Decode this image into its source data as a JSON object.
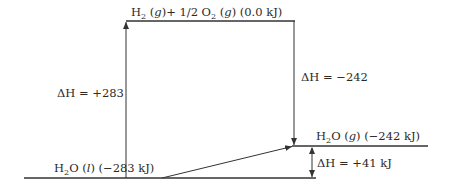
{
  "diagram": {
    "type": "enthalpy-level-diagram",
    "levels": {
      "top": {
        "species": "H",
        "sub": "2",
        "rest1": " (",
        "state": "g",
        "rest2": ")+ 1/2 O",
        "sub2": "2",
        "rest3": " (",
        "state2": "g",
        "rest4": ") (0.0 kJ)"
      },
      "gas": {
        "species": "H",
        "sub": "2",
        "rest1": "O (",
        "state": "g",
        "rest2": ") (−242 kJ)"
      },
      "liquid": {
        "species": "H",
        "sub": "2",
        "rest1": "O (",
        "state": "l",
        "rest2": ") (−283 kJ)"
      }
    },
    "arrows": {
      "up": {
        "label": "ΔH = +283"
      },
      "down": {
        "label": "ΔH = −242"
      },
      "vap": {
        "label": "ΔH = +41 kJ"
      }
    },
    "colors": {
      "line": "#333333",
      "text": "#2a2a2a"
    }
  }
}
